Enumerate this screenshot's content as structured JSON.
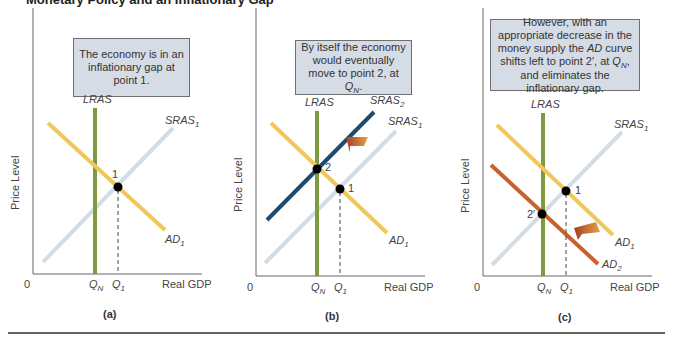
{
  "figure": {
    "title": "Monetary Policy and an Inflationary Gap",
    "colors": {
      "lras": "#7d9a3c",
      "ad1": "#f0c85a",
      "ad2": "#c8622a",
      "sras1": "#d3dde6",
      "sras2": "#1f4a6e",
      "arrow": "#b0502a",
      "note_bg": "#d5dce5",
      "axis": "#555555"
    },
    "panels": [
      {
        "caption": "(a)",
        "note": "The economy is in an inflationary gap at point 1.",
        "y_label": "Price Level",
        "x_label": "Real GDP",
        "origin_label": "0",
        "q_labels": [
          "QN",
          "Q1"
        ],
        "curves": [
          "LRAS",
          "SRAS1",
          "AD1"
        ],
        "points": [
          "1"
        ]
      },
      {
        "caption": "(b)",
        "note": "By itself the economy would eventually move to point 2, at QN.",
        "y_label": "Price Level",
        "x_label": "Real GDP",
        "origin_label": "0",
        "q_labels": [
          "QN",
          "Q1"
        ],
        "curves": [
          "LRAS",
          "SRAS2",
          "SRAS1",
          "AD1"
        ],
        "points": [
          "2",
          "1"
        ]
      },
      {
        "caption": "(c)",
        "note": "However, with an appropriate decrease in the money supply the AD curve shifts left to point 2′, at QN, and eliminates the inflationary gap.",
        "y_label": "Price Level",
        "x_label": "Real GDP",
        "origin_label": "0",
        "q_labels": [
          "QN",
          "Q1"
        ],
        "curves": [
          "LRAS",
          "SRAS1",
          "AD1",
          "AD2"
        ],
        "points": [
          "1",
          "2′"
        ]
      }
    ],
    "labels": {
      "lras": "LRAS",
      "sras": "SRAS",
      "ad": "AD",
      "q": "Q",
      "sub_1": "1",
      "sub_2": "2",
      "sub_n": "N",
      "pt1": "1",
      "pt2": "2",
      "pt2p": "2′",
      "price_level": "Price Level",
      "real_gdp": "Real GDP",
      "zero": "0",
      "cap_a": "(a)",
      "cap_b": "(b)",
      "cap_c": "(c)"
    },
    "notes": {
      "a": "The economy is in an inflationary gap at point 1.",
      "b_pre": "By itself the economy would eventually move to point 2, at ",
      "b_post": ".",
      "c_1": "However, with an appropriate decrease in the money supply the ",
      "c_ad": "AD",
      "c_2": " curve shifts left to point 2′, at ",
      "c_3": ", and eliminates the inflationary gap."
    }
  }
}
